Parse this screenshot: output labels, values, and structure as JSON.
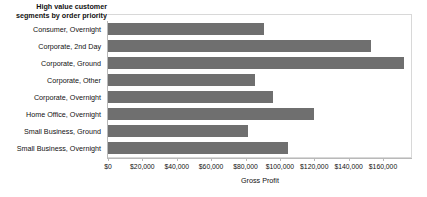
{
  "chart_data": {
    "type": "bar",
    "orientation": "horizontal",
    "title": "High value customer\nsegments by order priority",
    "xlabel": "Gross Profit",
    "ylabel": "",
    "grid": false,
    "legend": "none",
    "bar_color": "#6f6f6f",
    "xlim": [
      0,
      177000
    ],
    "xticks": [
      0,
      20000,
      40000,
      60000,
      80000,
      100000,
      120000,
      140000,
      160000
    ],
    "xtick_labels": [
      "$0",
      "$20,000",
      "$40,000",
      "$60,000",
      "$80,000",
      "$100,000",
      "$120,000",
      "$140,000",
      "$160,000"
    ],
    "categories": [
      "Consumer, Overnight",
      "Corporate, 2nd Day",
      "Corporate, Ground",
      "Corporate, Other",
      "Corporate, Overnight",
      "Home Office, Overnight",
      "Small Business, Ground",
      "Small Business, Overnight"
    ],
    "values": [
      91000,
      153000,
      172000,
      85500,
      96000,
      120000,
      81500,
      105000
    ]
  }
}
